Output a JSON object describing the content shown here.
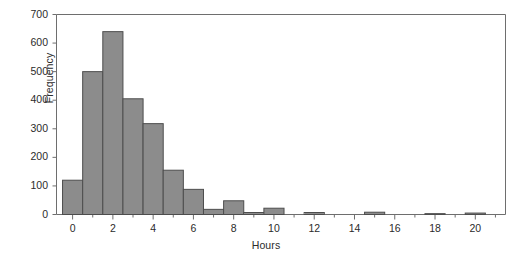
{
  "chart_data": {
    "type": "bar",
    "title": "",
    "subtitle": "",
    "xlabel": "Hours",
    "ylabel": "Frequency",
    "xlim": [
      -0.8,
      21.5
    ],
    "ylim": [
      0,
      700
    ],
    "grid": false,
    "legend": null,
    "bin_width": 1,
    "bar_fill_color": "#8c8c8c",
    "bar_edge_color": "#4d4d4d",
    "axis_color": "#6e6e6e",
    "categories": [
      "0",
      "1",
      "2",
      "3",
      "4",
      "5",
      "6",
      "7",
      "8",
      "9",
      "10",
      "11",
      "12",
      "13",
      "14",
      "15",
      "16",
      "17",
      "18",
      "19",
      "20"
    ],
    "x": [
      0,
      1,
      2,
      3,
      4,
      5,
      6,
      7,
      8,
      9,
      10,
      11,
      12,
      13,
      14,
      15,
      16,
      17,
      18,
      19,
      20
    ],
    "values": [
      120,
      500,
      640,
      405,
      318,
      155,
      88,
      18,
      48,
      7,
      22,
      0,
      7,
      0,
      0,
      8,
      0,
      0,
      3,
      0,
      5
    ],
    "ytick_labels": [
      "0",
      "100",
      "200",
      "300",
      "400",
      "500",
      "600",
      "700"
    ],
    "ytick_values": [
      0,
      100,
      200,
      300,
      400,
      500,
      600,
      700
    ],
    "xtick_labels": [
      "0",
      "2",
      "4",
      "6",
      "8",
      "10",
      "12",
      "14",
      "16",
      "18",
      "20"
    ],
    "xtick_values": [
      0,
      2,
      4,
      6,
      8,
      10,
      12,
      14,
      16,
      18,
      20
    ],
    "xminor_tick_values": [
      1,
      3,
      5,
      7,
      9,
      11,
      13,
      15,
      17,
      19,
      21
    ]
  }
}
